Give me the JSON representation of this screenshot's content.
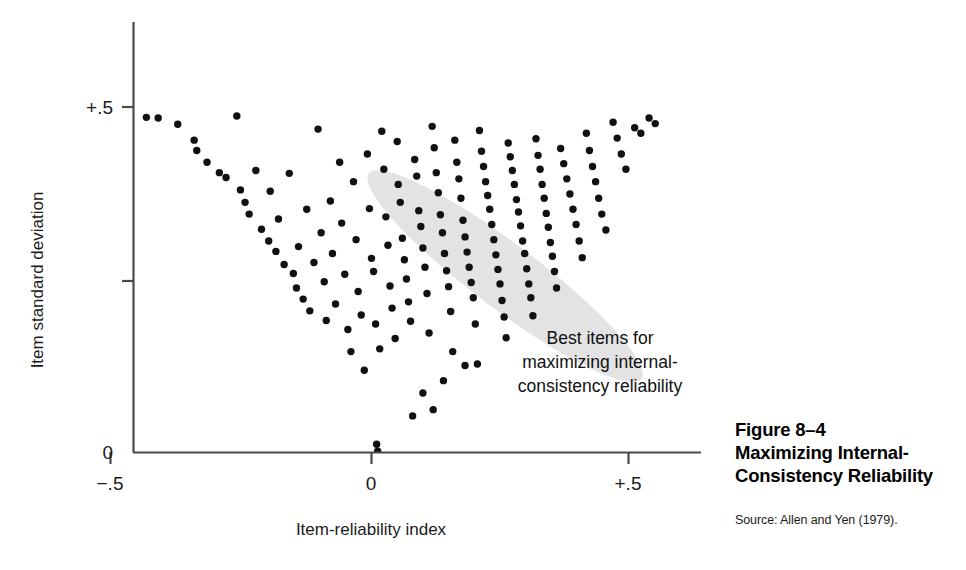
{
  "figure": {
    "caption_number": "Figure 8–4",
    "caption_title_line1": "Maximizing Internal-",
    "caption_title_line2": "Consistency Reliability",
    "source": "Source: Allen and Yen (1979)."
  },
  "annotation": {
    "line1": "Best items for",
    "line2": "maximizing internal-",
    "line3": "consistency reliability"
  },
  "colors": {
    "point": "#111111",
    "axis": "#4a4a4a",
    "highlight_ellipse": "#e3e3e3",
    "text": "#111111",
    "background": "#ffffff"
  },
  "chart_data": {
    "type": "scatter",
    "xlabel": "Item-reliability index",
    "ylabel": "Item standard deviation",
    "xlim": [
      -0.5,
      0.64
    ],
    "ylim": [
      0.0,
      0.56
    ],
    "xticks": [
      -0.5,
      0.0,
      0.5
    ],
    "xticklabels": [
      "−.5",
      "0",
      "+.5"
    ],
    "yticks": [
      0.0,
      0.25,
      0.5
    ],
    "yticklabels": [
      "0",
      "",
      "+.5"
    ],
    "grid": false,
    "legend": false,
    "highlight_region": {
      "label": "Best items for maximizing internal-consistency reliability",
      "shape": "ellipse",
      "center_x": 0.26,
      "center_y": 0.255,
      "semi_major": 0.247,
      "semi_minor": 0.063,
      "rotation_deg": -53,
      "fill": "#e3e3e3"
    },
    "points": [
      [
        -0.438,
        0.485
      ],
      [
        -0.415,
        0.484
      ],
      [
        -0.377,
        0.475
      ],
      [
        -0.345,
        0.452
      ],
      [
        -0.34,
        0.437
      ],
      [
        -0.32,
        0.42
      ],
      [
        -0.296,
        0.405
      ],
      [
        -0.283,
        0.398
      ],
      [
        -0.262,
        0.487
      ],
      [
        -0.255,
        0.38
      ],
      [
        -0.246,
        0.362
      ],
      [
        -0.238,
        0.345
      ],
      [
        -0.225,
        0.408
      ],
      [
        -0.214,
        0.323
      ],
      [
        -0.2,
        0.306
      ],
      [
        -0.197,
        0.378
      ],
      [
        -0.186,
        0.291
      ],
      [
        -0.181,
        0.338
      ],
      [
        -0.17,
        0.272
      ],
      [
        -0.16,
        0.404
      ],
      [
        -0.152,
        0.259
      ],
      [
        -0.146,
        0.238
      ],
      [
        -0.142,
        0.298
      ],
      [
        -0.133,
        0.222
      ],
      [
        -0.126,
        0.352
      ],
      [
        -0.12,
        0.205
      ],
      [
        -0.112,
        0.275
      ],
      [
        -0.104,
        0.468
      ],
      [
        -0.098,
        0.318
      ],
      [
        -0.092,
        0.247
      ],
      [
        -0.088,
        0.191
      ],
      [
        -0.08,
        0.364
      ],
      [
        -0.076,
        0.288
      ],
      [
        -0.07,
        0.215
      ],
      [
        -0.062,
        0.42
      ],
      [
        -0.058,
        0.332
      ],
      [
        -0.052,
        0.258
      ],
      [
        -0.046,
        0.178
      ],
      [
        -0.04,
        0.146
      ],
      [
        -0.035,
        0.392
      ],
      [
        -0.03,
        0.308
      ],
      [
        -0.026,
        0.233
      ],
      [
        -0.02,
        0.199
      ],
      [
        -0.014,
        0.119
      ],
      [
        -0.008,
        0.432
      ],
      [
        -0.004,
        0.353
      ],
      [
        0.0,
        0.281
      ],
      [
        0.004,
        0.262
      ],
      [
        0.008,
        0.186
      ],
      [
        0.01,
        0.012
      ],
      [
        0.012,
        0.002
      ],
      [
        0.016,
        0.15
      ],
      [
        0.02,
        0.465
      ],
      [
        0.024,
        0.41
      ],
      [
        0.028,
        0.341
      ],
      [
        0.032,
        0.3
      ],
      [
        0.036,
        0.241
      ],
      [
        0.04,
        0.209
      ],
      [
        0.046,
        0.165
      ],
      [
        0.05,
        0.45
      ],
      [
        0.052,
        0.388
      ],
      [
        0.056,
        0.362
      ],
      [
        0.06,
        0.31
      ],
      [
        0.064,
        0.279
      ],
      [
        0.068,
        0.251
      ],
      [
        0.072,
        0.218
      ],
      [
        0.076,
        0.19
      ],
      [
        0.08,
        0.053
      ],
      [
        0.084,
        0.424
      ],
      [
        0.088,
        0.4
      ],
      [
        0.092,
        0.35
      ],
      [
        0.096,
        0.327
      ],
      [
        0.1,
        0.296
      ],
      [
        0.104,
        0.268
      ],
      [
        0.108,
        0.23
      ],
      [
        0.112,
        0.173
      ],
      [
        0.118,
        0.472
      ],
      [
        0.122,
        0.441
      ],
      [
        0.126,
        0.405
      ],
      [
        0.13,
        0.376
      ],
      [
        0.134,
        0.344
      ],
      [
        0.138,
        0.318
      ],
      [
        0.142,
        0.288
      ],
      [
        0.146,
        0.263
      ],
      [
        0.15,
        0.24
      ],
      [
        0.154,
        0.204
      ],
      [
        0.158,
        0.146
      ],
      [
        0.162,
        0.452
      ],
      [
        0.166,
        0.42
      ],
      [
        0.17,
        0.396
      ],
      [
        0.174,
        0.368
      ],
      [
        0.178,
        0.336
      ],
      [
        0.182,
        0.312
      ],
      [
        0.186,
        0.29
      ],
      [
        0.19,
        0.268
      ],
      [
        0.194,
        0.246
      ],
      [
        0.198,
        0.224
      ],
      [
        0.202,
        0.186
      ],
      [
        0.206,
        0.128
      ],
      [
        0.21,
        0.466
      ],
      [
        0.214,
        0.436
      ],
      [
        0.218,
        0.414
      ],
      [
        0.222,
        0.392
      ],
      [
        0.226,
        0.372
      ],
      [
        0.23,
        0.352
      ],
      [
        0.234,
        0.33
      ],
      [
        0.238,
        0.308
      ],
      [
        0.242,
        0.286
      ],
      [
        0.246,
        0.265
      ],
      [
        0.25,
        0.244
      ],
      [
        0.254,
        0.22
      ],
      [
        0.258,
        0.196
      ],
      [
        0.262,
        0.166
      ],
      [
        0.266,
        0.448
      ],
      [
        0.27,
        0.428
      ],
      [
        0.274,
        0.408
      ],
      [
        0.278,
        0.388
      ],
      [
        0.282,
        0.366
      ],
      [
        0.286,
        0.348
      ],
      [
        0.29,
        0.328
      ],
      [
        0.294,
        0.306
      ],
      [
        0.298,
        0.288
      ],
      [
        0.302,
        0.266
      ],
      [
        0.306,
        0.244
      ],
      [
        0.31,
        0.224
      ],
      [
        0.314,
        0.198
      ],
      [
        0.32,
        0.454
      ],
      [
        0.324,
        0.43
      ],
      [
        0.328,
        0.41
      ],
      [
        0.332,
        0.388
      ],
      [
        0.336,
        0.368
      ],
      [
        0.34,
        0.346
      ],
      [
        0.344,
        0.326
      ],
      [
        0.348,
        0.304
      ],
      [
        0.352,
        0.284
      ],
      [
        0.356,
        0.262
      ],
      [
        0.36,
        0.238
      ],
      [
        0.368,
        0.44
      ],
      [
        0.374,
        0.418
      ],
      [
        0.38,
        0.396
      ],
      [
        0.386,
        0.374
      ],
      [
        0.392,
        0.352
      ],
      [
        0.398,
        0.33
      ],
      [
        0.404,
        0.306
      ],
      [
        0.41,
        0.282
      ],
      [
        0.418,
        0.462
      ],
      [
        0.424,
        0.437
      ],
      [
        0.43,
        0.414
      ],
      [
        0.436,
        0.392
      ],
      [
        0.442,
        0.368
      ],
      [
        0.448,
        0.345
      ],
      [
        0.456,
        0.322
      ],
      [
        0.47,
        0.478
      ],
      [
        0.478,
        0.455
      ],
      [
        0.486,
        0.432
      ],
      [
        0.495,
        0.41
      ],
      [
        0.512,
        0.47
      ],
      [
        0.524,
        0.462
      ],
      [
        0.54,
        0.484
      ],
      [
        0.552,
        0.476
      ],
      [
        0.1,
        0.086
      ],
      [
        0.14,
        0.104
      ],
      [
        0.182,
        0.126
      ],
      [
        0.12,
        0.062
      ]
    ]
  }
}
